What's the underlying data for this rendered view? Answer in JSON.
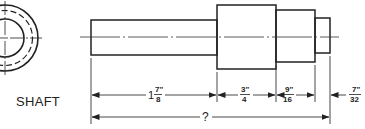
{
  "drawing": {
    "title": "SHAFT",
    "end_view": {
      "type": "concentric-circles",
      "rings": [
        "outer",
        "hidden-dashed",
        "inner"
      ]
    },
    "sections": [
      {
        "name": "section-1",
        "length_label": "1 7/8\""
      },
      {
        "name": "section-2",
        "length_label": "3/4\""
      },
      {
        "name": "section-3",
        "length_label": "9/16\""
      },
      {
        "name": "section-4",
        "length_label": "7/32\""
      }
    ],
    "dimensions": {
      "d1": {
        "whole": "1",
        "num": "7\"",
        "den": "8"
      },
      "d2": {
        "num": "3\"",
        "den": "4"
      },
      "d3": {
        "num": "9\"",
        "den": "16"
      },
      "d4": {
        "num": "7\"",
        "den": "32"
      },
      "overall": "?"
    }
  },
  "colors": {
    "line": "#222222",
    "background": "#ffffff"
  }
}
